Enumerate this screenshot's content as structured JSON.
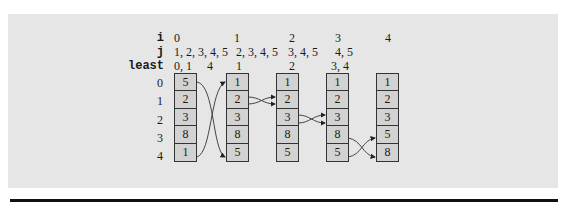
{
  "diagram": {
    "row_labels": {
      "i": "i",
      "j": "j",
      "least": "least"
    },
    "iterations": [
      {
        "i": "0",
        "j": "1, 2, 3, 4, 5",
        "least": "0, 1     4"
      },
      {
        "i": "1",
        "j": "2, 3, 4, 5",
        "least": "1"
      },
      {
        "i": "2",
        "j": "3, 4, 5",
        "least": "2"
      },
      {
        "i": "3",
        "j": "4, 5",
        "least": "3, 4"
      },
      {
        "i": "4",
        "j": "",
        "least": ""
      }
    ],
    "indices": [
      "0",
      "1",
      "2",
      "3",
      "4"
    ],
    "arrays": [
      [
        "5",
        "2",
        "3",
        "8",
        "1"
      ],
      [
        "1",
        "2",
        "3",
        "8",
        "5"
      ],
      [
        "1",
        "2",
        "3",
        "8",
        "5"
      ],
      [
        "1",
        "2",
        "3",
        "8",
        "5"
      ],
      [
        "1",
        "2",
        "3",
        "5",
        "8"
      ]
    ],
    "swaps": [
      {
        "from_array": 0,
        "rows": [
          0,
          4
        ]
      },
      {
        "from_array": 1,
        "rows": [
          1,
          1
        ]
      },
      {
        "from_array": 2,
        "rows": [
          2,
          2
        ]
      },
      {
        "from_array": 3,
        "rows": [
          3,
          4
        ]
      }
    ],
    "colors": {
      "panel": "#e6e6e6",
      "cell": "#d2d2d2",
      "line": "#333333"
    }
  }
}
